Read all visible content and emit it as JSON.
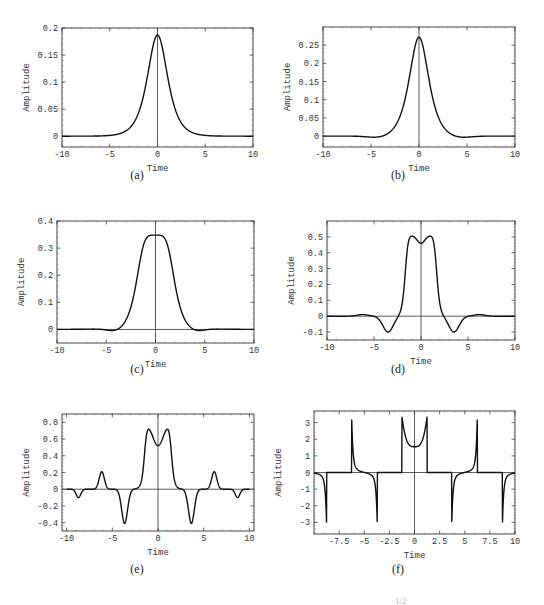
{
  "figure": {
    "caption_fragment": "1/2"
  },
  "chart_data": [
    {
      "id": "a",
      "type": "line",
      "panel_label": "(a)",
      "xlabel": "Time",
      "ylabel": "Amplitude",
      "xlim": [
        -10,
        10
      ],
      "ylim": [
        -0.02,
        0.2
      ],
      "xticks": [
        -10,
        -5,
        0,
        5,
        10
      ],
      "yticks": [
        0,
        0.05,
        0.1,
        0.15,
        0.2
      ],
      "ytick_labels": [
        "0",
        "0.05",
        "0.1",
        "0.15",
        "0.2"
      ],
      "frame": {
        "x": 62,
        "y": 28,
        "w": 191,
        "h": 119
      },
      "zero_line": false,
      "curve": {
        "kind": "gauss",
        "amp": 0.187,
        "sigma": 1.05,
        "dip": 0,
        "side": []
      }
    },
    {
      "id": "b",
      "type": "line",
      "panel_label": "(b)",
      "xlabel": "Time",
      "ylabel": "Amplitude",
      "xlim": [
        -10,
        10
      ],
      "ylim": [
        -0.03,
        0.3
      ],
      "xticks": [
        -10,
        -5,
        0,
        5,
        10
      ],
      "yticks": [
        0,
        0.05,
        0.1,
        0.15,
        0.2,
        0.25
      ],
      "ytick_labels": [
        "0",
        "0.05",
        "0.1",
        "0.15",
        "0.2",
        "0.25"
      ],
      "frame": {
        "x": 323,
        "y": 27,
        "w": 192,
        "h": 120
      },
      "zero_line": false,
      "curve": {
        "kind": "sech",
        "amp": 0.272,
        "width": 1.05,
        "side": [
          {
            "c": 4.0,
            "a": -0.006,
            "w": 1.2
          },
          {
            "c": -4.0,
            "a": -0.006,
            "w": 1.2
          }
        ]
      }
    },
    {
      "id": "c",
      "type": "line",
      "panel_label": "(c)",
      "xlabel": "Time",
      "ylabel": "Amplitude",
      "xlim": [
        -10,
        10
      ],
      "ylim": [
        -0.05,
        0.4
      ],
      "xticks": [
        -10,
        -5,
        0,
        5,
        10
      ],
      "yticks": [
        0,
        0.1,
        0.2,
        0.3,
        0.4
      ],
      "ytick_labels": [
        "0",
        "0.1",
        "0.2",
        "0.3",
        "0.4"
      ],
      "frame": {
        "x": 57,
        "y": 221,
        "w": 197,
        "h": 122
      },
      "zero_line": true,
      "curve": {
        "kind": "flat",
        "amp": 0.348,
        "width": 1.35,
        "p": 4,
        "side": [
          {
            "c": 3.9,
            "a": -0.015,
            "w": 0.9
          },
          {
            "c": -3.9,
            "a": -0.015,
            "w": 0.9
          }
        ]
      }
    },
    {
      "id": "d",
      "type": "line",
      "panel_label": "(d)",
      "xlabel": "Time",
      "ylabel": "Amplitude",
      "xlim": [
        -10,
        10
      ],
      "ylim": [
        -0.15,
        0.6
      ],
      "xticks": [
        -10,
        -5,
        0,
        5,
        10
      ],
      "yticks": [
        -0.1,
        0,
        0.1,
        0.2,
        0.3,
        0.4,
        0.5
      ],
      "ytick_labels": [
        "-0.1",
        "0",
        "0.1",
        "0.2",
        "0.3",
        "0.4",
        "0.5"
      ],
      "frame": {
        "x": 327,
        "y": 221,
        "w": 188,
        "h": 119
      },
      "zero_line": true,
      "curve": {
        "kind": "double",
        "amp": 0.51,
        "center_val": 0.46,
        "peak_pos": 0.75,
        "width": 1.7,
        "side": [
          {
            "c": 3.5,
            "a": -0.1,
            "w": 0.55
          },
          {
            "c": -3.5,
            "a": -0.1,
            "w": 0.55
          },
          {
            "c": 6.2,
            "a": 0.01,
            "w": 0.6
          },
          {
            "c": -6.2,
            "a": 0.01,
            "w": 0.6
          }
        ]
      }
    },
    {
      "id": "e",
      "type": "line",
      "panel_label": "(e)",
      "xlabel": "Time",
      "ylabel": "Amplitude",
      "xlim": [
        -10.5,
        10.5
      ],
      "ylim": [
        -0.5,
        0.9
      ],
      "xticks": [
        -10,
        -5,
        0,
        5,
        10
      ],
      "yticks": [
        -0.4,
        -0.2,
        0,
        0.2,
        0.4,
        0.6,
        0.8
      ],
      "ytick_labels": [
        "-0.4",
        "-0.2",
        "0",
        "0.2",
        "0.4",
        "0.6",
        "0.8"
      ],
      "frame": {
        "x": 62,
        "y": 414,
        "w": 192,
        "h": 117
      },
      "zero_line": true,
      "curve": {
        "kind": "double",
        "amp": 0.78,
        "center_val": 0.52,
        "peak_pos": 1.0,
        "width": 1.5,
        "side": [
          {
            "c": 3.65,
            "a": -0.41,
            "w": 0.32
          },
          {
            "c": -3.65,
            "a": -0.41,
            "w": 0.32
          },
          {
            "c": 6.15,
            "a": 0.21,
            "w": 0.28
          },
          {
            "c": -6.15,
            "a": 0.21,
            "w": 0.28
          },
          {
            "c": 8.7,
            "a": -0.1,
            "w": 0.25
          },
          {
            "c": -8.7,
            "a": -0.1,
            "w": 0.25
          }
        ]
      }
    },
    {
      "id": "f",
      "type": "line",
      "panel_label": "(f)",
      "xlabel": "Time",
      "ylabel": "Amplitude",
      "xlim": [
        -10,
        10
      ],
      "ylim": [
        -3.7,
        3.7
      ],
      "xticks": [
        -7.5,
        -5,
        -2.5,
        0,
        2.5,
        5,
        7.5,
        10
      ],
      "xtick_labels": [
        "-7.5",
        "-5",
        "-2.5",
        "0",
        "2.5",
        "5",
        "7.5",
        "10"
      ],
      "yticks": [
        -3,
        -2,
        -1,
        0,
        1,
        2,
        3
      ],
      "ytick_labels": [
        "-3",
        "-2",
        "-1",
        "0",
        "1",
        "2",
        "3"
      ],
      "frame": {
        "x": 314,
        "y": 411,
        "w": 201,
        "h": 123
      },
      "zero_line": true,
      "curve": {
        "kind": "periodic_spikes",
        "center_val": 1.55,
        "edge": 1.25,
        "peak": 3.35,
        "spikes": [
          {
            "c": -8.75,
            "a": -3.1
          },
          {
            "c": -6.25,
            "a": 3.3
          },
          {
            "c": -3.7,
            "a": -3.2
          },
          {
            "c": 3.7,
            "a": -3.2
          },
          {
            "c": 6.25,
            "a": 3.3
          },
          {
            "c": 8.75,
            "a": -3.1
          }
        ]
      }
    }
  ],
  "panel_captions": [
    {
      "label": "(a)",
      "x": 137,
      "y": 176
    },
    {
      "label": "(b)",
      "x": 398,
      "y": 176
    },
    {
      "label": "(c)",
      "x": 137,
      "y": 370
    },
    {
      "label": "(d)",
      "x": 398,
      "y": 370
    },
    {
      "label": "(e)",
      "x": 137,
      "y": 570
    },
    {
      "label": "(f)",
      "x": 398,
      "y": 570
    }
  ]
}
